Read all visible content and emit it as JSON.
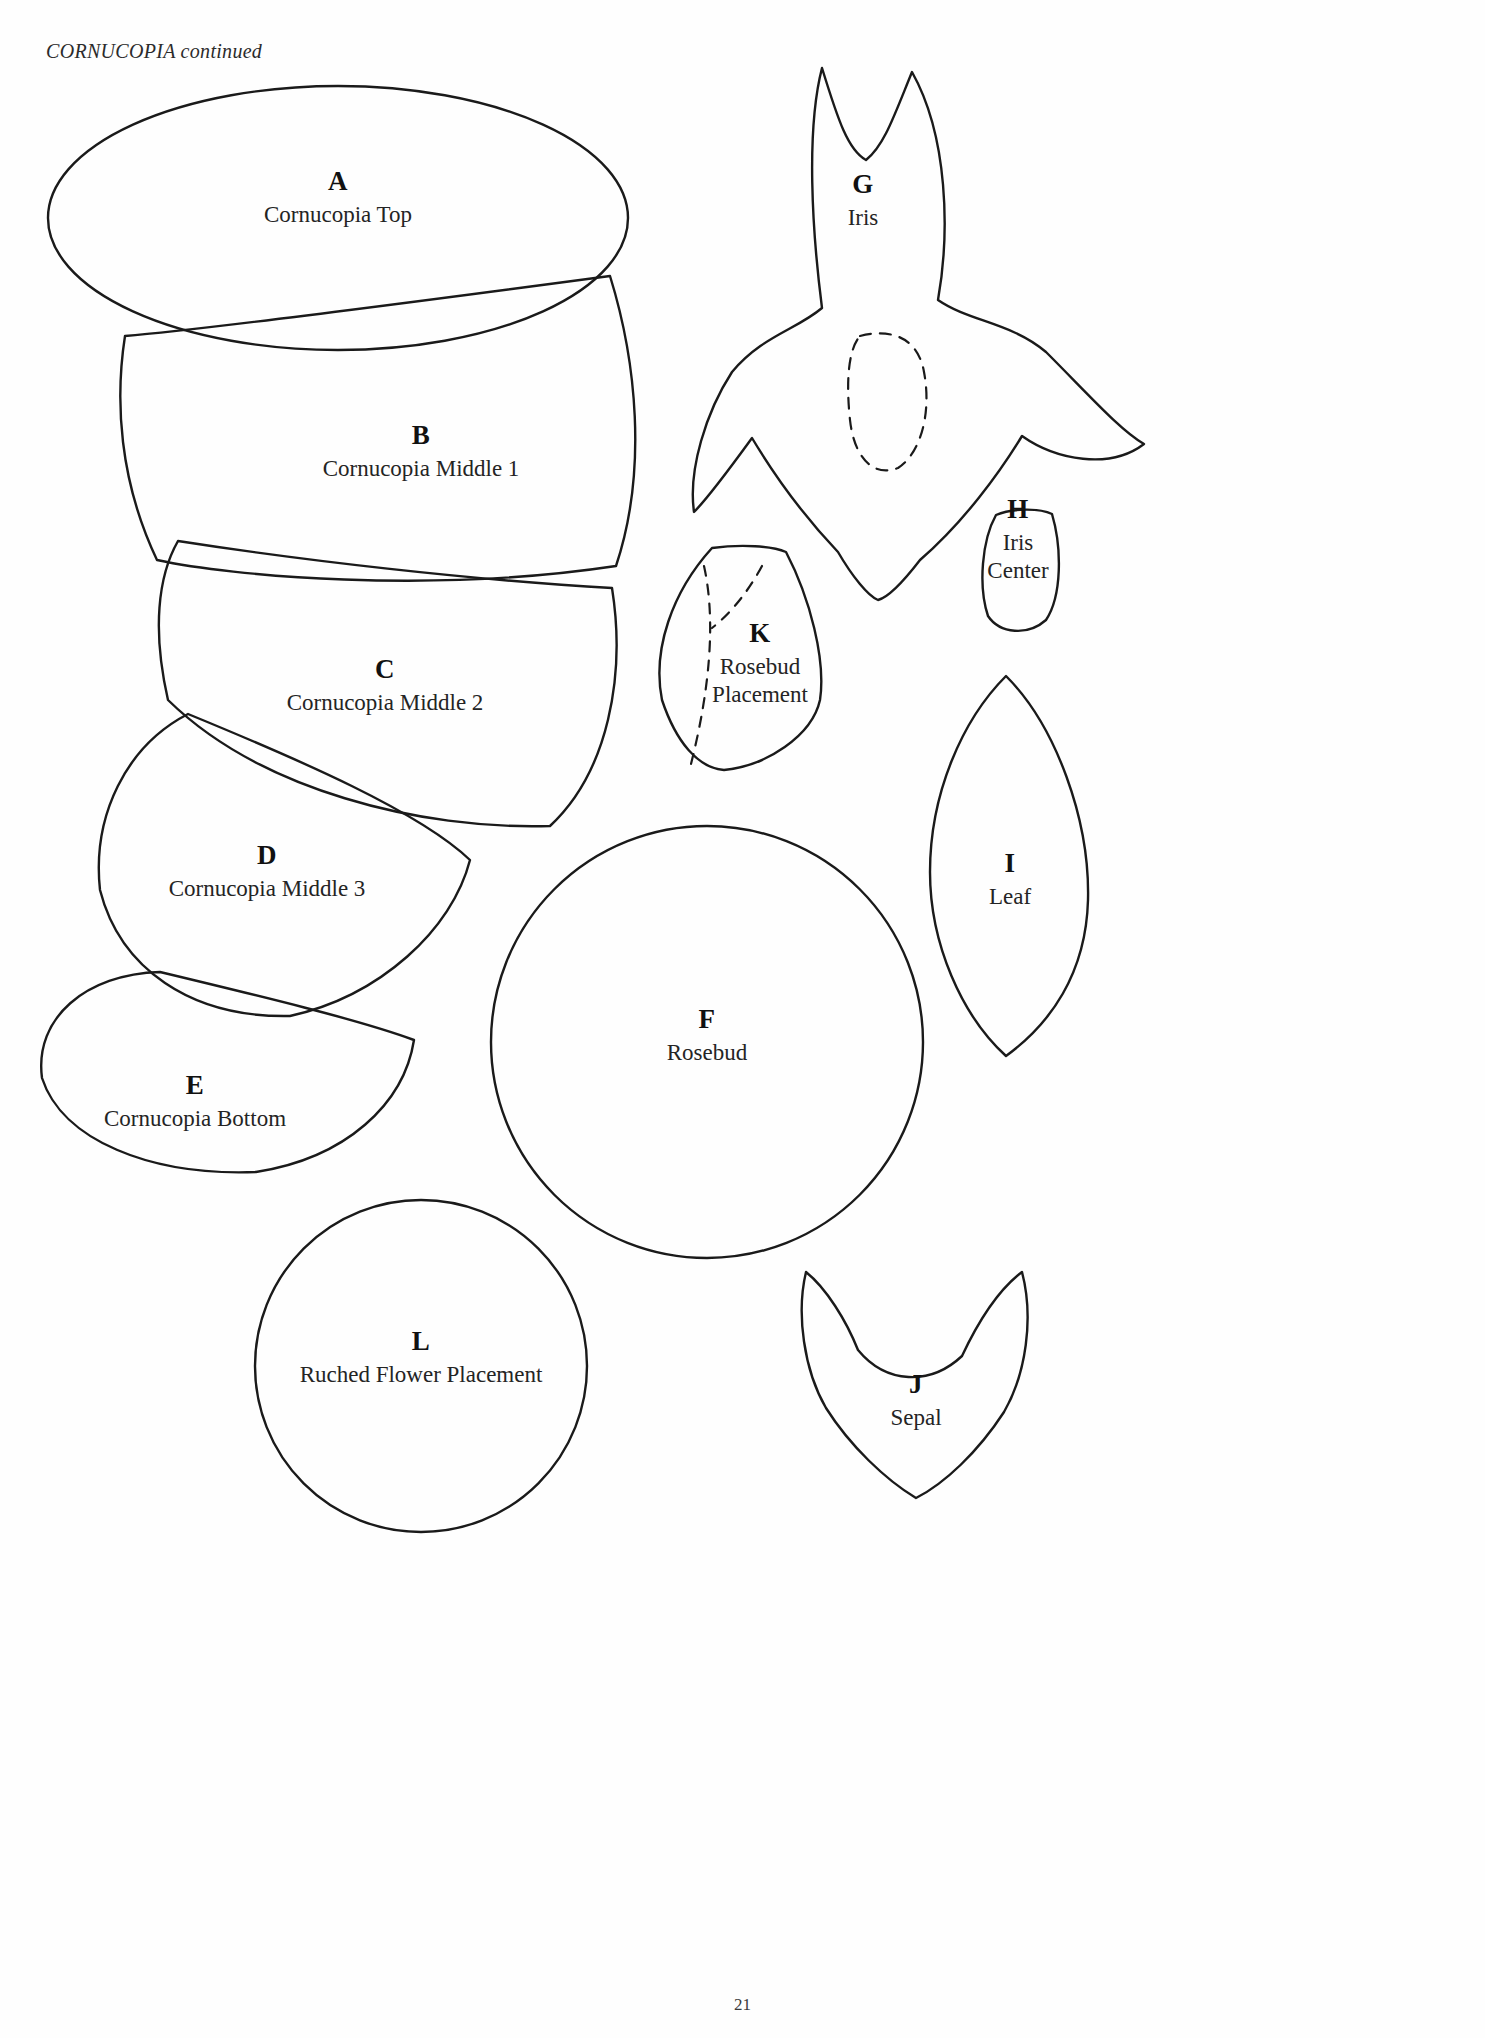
{
  "page": {
    "header": "CORNUCOPIA continued",
    "page_number": "21",
    "background_color": "#ffffff",
    "outline_color": "#1a1a1a"
  },
  "pieces": [
    {
      "id": "A",
      "letter": "A",
      "caption": "Cornucopia Top",
      "caption_lines": [
        "Cornucopia Top"
      ],
      "label_x": 338,
      "label_y": 167
    },
    {
      "id": "B",
      "letter": "B",
      "caption": "Cornucopia Middle 1",
      "caption_lines": [
        "Cornucopia Middle 1"
      ],
      "label_x": 421,
      "label_y": 421
    },
    {
      "id": "C",
      "letter": "C",
      "caption": "Cornucopia Middle 2",
      "caption_lines": [
        "Cornucopia Middle 2"
      ],
      "label_x": 385,
      "label_y": 655
    },
    {
      "id": "D",
      "letter": "D",
      "caption": "Cornucopia Middle 3",
      "caption_lines": [
        "Cornucopia Middle 3"
      ],
      "label_x": 267,
      "label_y": 841
    },
    {
      "id": "E",
      "letter": "E",
      "caption": "Cornucopia Bottom",
      "caption_lines": [
        "Cornucopia Bottom"
      ],
      "label_x": 195,
      "label_y": 1071
    },
    {
      "id": "F",
      "letter": "F",
      "caption": "Rosebud",
      "caption_lines": [
        "Rosebud"
      ],
      "label_x": 707,
      "label_y": 1005
    },
    {
      "id": "G",
      "letter": "G",
      "caption": "Iris",
      "caption_lines": [
        "Iris"
      ],
      "label_x": 863,
      "label_y": 170
    },
    {
      "id": "H",
      "letter": "H",
      "caption": "Iris Center",
      "caption_lines": [
        "Iris",
        "Center"
      ],
      "label_x": 1018,
      "label_y": 495
    },
    {
      "id": "I",
      "letter": "I",
      "caption": "Leaf",
      "caption_lines": [
        "Leaf"
      ],
      "label_x": 1010,
      "label_y": 849
    },
    {
      "id": "J",
      "letter": "J",
      "caption": "Sepal",
      "caption_lines": [
        "Sepal"
      ],
      "label_x": 916,
      "label_y": 1370
    },
    {
      "id": "K",
      "letter": "K",
      "caption": "Rosebud Placement",
      "caption_lines": [
        "Rosebud",
        "Placement"
      ],
      "label_x": 760,
      "label_y": 619
    },
    {
      "id": "L",
      "letter": "L",
      "caption": "Ruched Flower Placement",
      "caption_lines": [
        "Ruched Flower Placement"
      ],
      "label_x": 421,
      "label_y": 1327
    }
  ]
}
